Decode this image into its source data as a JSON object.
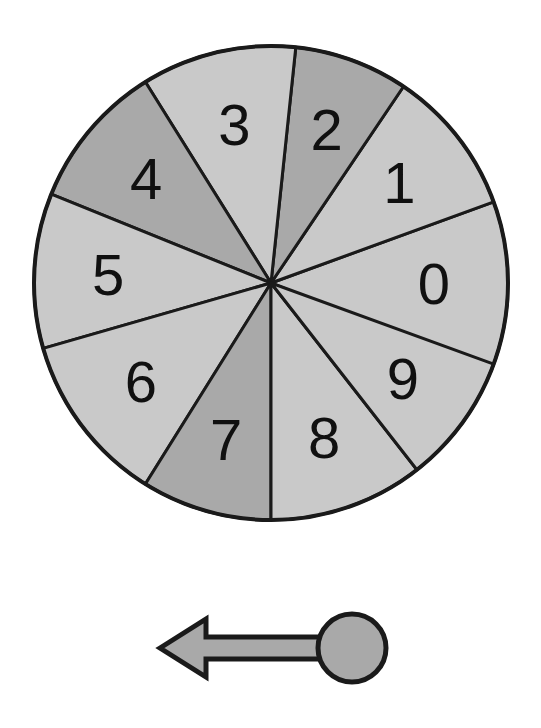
{
  "page": {
    "background_color": "#ffffff",
    "width": 541,
    "height": 728
  },
  "wheel": {
    "name": "ten-sector-spinner-wheel",
    "center_x": 271,
    "center_y": 283,
    "radius": 237,
    "outline_color": "#1a1a1a",
    "outline_width": 4,
    "divider_color": "#1a1a1a",
    "divider_width": 3,
    "light_fill": "#c9c9c9",
    "dark_fill": "#a9a9a9",
    "label_color": "#101010",
    "label_radius": 163,
    "sector_count": 10,
    "sectors": [
      {
        "label": "0",
        "shade": "light",
        "start_angle": -20,
        "end_angle": 22,
        "label_angle": 0,
        "fill": "#c9c9c9"
      },
      {
        "label": "1",
        "shade": "light",
        "start_angle": -56,
        "end_angle": -20,
        "label_angle": -38,
        "fill": "#c9c9c9"
      },
      {
        "label": "2",
        "shade": "dark",
        "start_angle": -84,
        "end_angle": -56,
        "label_angle": -70,
        "fill": "#a9a9a9"
      },
      {
        "label": "3",
        "shade": "light",
        "start_angle": -122,
        "end_angle": -84,
        "label_angle": -103,
        "fill": "#c9c9c9"
      },
      {
        "label": "4",
        "shade": "dark",
        "start_angle": -158,
        "end_angle": -122,
        "label_angle": -140,
        "fill": "#a9a9a9"
      },
      {
        "label": "5",
        "shade": "light",
        "start_angle": -196,
        "end_angle": -158,
        "label_angle": -177,
        "fill": "#c9c9c9"
      },
      {
        "label": "6",
        "shade": "light",
        "start_angle": -238,
        "end_angle": -196,
        "label_angle": -217,
        "fill": "#c9c9c9"
      },
      {
        "label": "7",
        "shade": "dark",
        "start_angle": -270,
        "end_angle": -238,
        "label_angle": -254,
        "fill": "#a9a9a9"
      },
      {
        "label": "8",
        "shade": "light",
        "start_angle": -308,
        "end_angle": -270,
        "label_angle": -289,
        "fill": "#c9c9c9"
      },
      {
        "label": "9",
        "shade": "light",
        "start_angle": -340,
        "end_angle": -308,
        "label_angle": -324,
        "fill": "#c9c9c9"
      }
    ]
  },
  "pointer": {
    "name": "spinner-pointer-arrow",
    "direction": "left",
    "fill": "#a9a9a9",
    "outline_color": "#1a1a1a",
    "outline_width": 5,
    "hub_center_x": 352,
    "hub_center_y": 648,
    "hub_radius": 34,
    "tip_x": 160,
    "shaft_half_height": 11,
    "head_half_height": 29,
    "head_length": 46
  }
}
